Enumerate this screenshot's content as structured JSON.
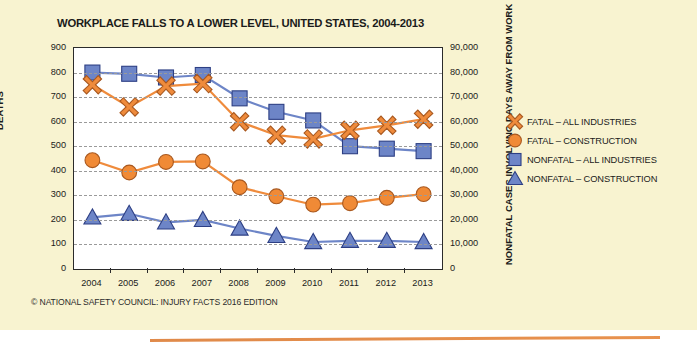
{
  "card": {
    "background_color": "#f8f3d0",
    "accent_rule_color": "#e08a4a"
  },
  "title": "WORKPLACE FALLS TO A LOWER LEVEL, UNITED STATES, 2004-2013",
  "footer": "© NATIONAL SAFETY COUNCIL: INJURY FACTS 2016 EDITION",
  "axes": {
    "left_label": "DEATHS",
    "right_label": "NONFATAL CASES INVOLVING DAYS AWAY FROM WORK",
    "left_ticks": [
      "0",
      "100",
      "200",
      "300",
      "400",
      "500",
      "600",
      "700",
      "800",
      "900"
    ],
    "right_ticks": [
      "0",
      "10,000",
      "20,000",
      "30,000",
      "40,000",
      "50,000",
      "60,000",
      "70,000",
      "80,000",
      "90,000"
    ]
  },
  "legend": {
    "items": [
      {
        "label": "FATAL – ALL INDUSTRIES",
        "marker": "x-icon",
        "color": "#ef8b3c"
      },
      {
        "label": "FATAL – CONSTRUCTION",
        "marker": "circle-icon",
        "color": "#f08a36"
      },
      {
        "label": "NONFATAL – ALL INDUSTRIES",
        "marker": "square-icon",
        "color": "#6d85c7"
      },
      {
        "label": "NONFATAL – CONSTRUCTION",
        "marker": "triangle-icon",
        "color": "#6d85c7"
      }
    ]
  },
  "chart_data": {
    "type": "line",
    "title": "WORKPLACE FALLS TO A LOWER LEVEL, UNITED STATES, 2004-2013",
    "xlabel": "",
    "ylabel": "DEATHS",
    "y2label": "NONFATAL CASES INVOLVING DAYS AWAY FROM WORK",
    "categories": [
      "2004",
      "2005",
      "2006",
      "2007",
      "2008",
      "2009",
      "2010",
      "2011",
      "2012",
      "2013"
    ],
    "ylim": [
      0,
      900
    ],
    "y2lim": [
      0,
      90000
    ],
    "grid": true,
    "legend_position": "right",
    "series": [
      {
        "name": "FATAL – ALL INDUSTRIES",
        "axis": "left",
        "marker": "x",
        "color": "#ef8b3c",
        "values": [
          750,
          660,
          745,
          755,
          600,
          545,
          530,
          565,
          585,
          610
        ]
      },
      {
        "name": "FATAL – CONSTRUCTION",
        "axis": "left",
        "marker": "circle",
        "color": "#f08a36",
        "values": [
          443,
          393,
          436,
          438,
          333,
          296,
          262,
          268,
          290,
          305
        ]
      },
      {
        "name": "NONFATAL – ALL INDUSTRIES",
        "axis": "right",
        "marker": "square",
        "color": "#6d85c7",
        "values": [
          80000,
          79500,
          78000,
          79000,
          69500,
          64000,
          60500,
          50000,
          49000,
          48000
        ]
      },
      {
        "name": "NONFATAL – CONSTRUCTION",
        "axis": "right",
        "marker": "triangle",
        "color": "#6d85c7",
        "values": [
          21000,
          22500,
          19000,
          20000,
          16500,
          13500,
          11000,
          11500,
          11500,
          11000
        ]
      }
    ]
  }
}
